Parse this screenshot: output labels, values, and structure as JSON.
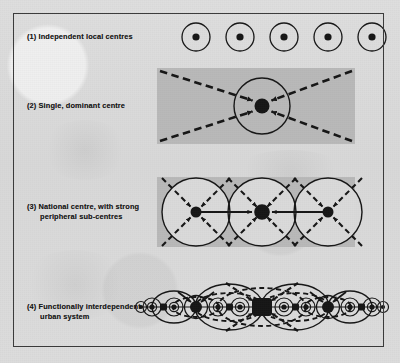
{
  "figure": {
    "background_color": "#dcdcdc",
    "frame_color": "#3a3a3a",
    "ink_color": "#161616",
    "shade_color": "#b9b9b9"
  },
  "rows": [
    {
      "id": "row-1",
      "number": "(1)",
      "label": "(1) Independent local centres",
      "label_lines": [
        "(1) Independent local centres"
      ],
      "diagram": {
        "type": "independent-centres",
        "shading": false,
        "centres": 5,
        "centre_x": [
          196,
          240,
          284,
          328,
          372
        ],
        "centre_y": 37,
        "ring_radius": 14,
        "dot_radius": 3.6,
        "flows": "none"
      }
    },
    {
      "id": "row-2",
      "number": "(2)",
      "label": "(2) Single, dominant centre",
      "label_lines": [
        "(2) Single, dominant centre"
      ],
      "diagram": {
        "type": "single-dominant-centre",
        "shading": true,
        "shade_rect": {
          "x": 157,
          "y": 68,
          "w": 198,
          "h": 76
        },
        "centres": 1,
        "centre_x": [
          262
        ],
        "centre_y": 106,
        "ring_radius": 28,
        "dot_radius": 7.5,
        "flows": "four-dashed-arrows-inward"
      }
    },
    {
      "id": "row-3",
      "number": "(3)",
      "label": "(3) National centre, with strong peripheral sub-centres",
      "label_lines": [
        "(3) National centre, with strong",
        "      peripheral sub-centres"
      ],
      "diagram": {
        "type": "national-centre-with-subcentres",
        "shading": true,
        "shade_rect": {
          "x": 157,
          "y": 177,
          "w": 198,
          "h": 70
        },
        "centres": 3,
        "centre_x": [
          196,
          262,
          328
        ],
        "centre_y": 212,
        "ring_radius": 34,
        "dot_radius_main": 7.5,
        "dot_radius_sub": 5.5,
        "flows": "dashed-diagonal-inward-plus-solid-horizontal-inward"
      }
    },
    {
      "id": "row-4",
      "number": "(4)",
      "label": "(4) Functionally interdependent urban system",
      "label_lines": [
        "(4) Functionally interdependent",
        "      urban system"
      ],
      "diagram": {
        "type": "functionally-interdependent-urban-system",
        "shading": false,
        "centre_y": 307,
        "hierarchy": {
          "major_x": [
            262
          ],
          "intermediate_x": [
            196,
            328
          ],
          "minor_x": [
            152,
            174,
            218,
            240,
            284,
            306,
            350,
            372
          ],
          "major_radius": 8,
          "intermediate_radius": 6,
          "minor_radius": 3.2
        },
        "flows": "nested-dashed-and-solid-arc-linkages"
      }
    }
  ]
}
